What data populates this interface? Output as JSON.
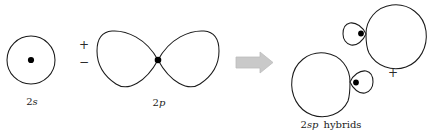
{
  "diagram": {
    "background_color": "#ffffff",
    "stroke_color": "#1a1a1a",
    "arrow_color": "#c9c9c9",
    "nucleus_color": "#000000"
  },
  "orbitals": {
    "s_orbital": {
      "label_prefix": "2",
      "label_suffix": "s",
      "label_full": "2s",
      "shape": "circle",
      "center_x": 31,
      "center_y": 60,
      "radius": 24,
      "has_nucleus_dot": true
    },
    "p_orbital": {
      "label_prefix": "2",
      "label_suffix": "p",
      "label_full": "2p",
      "shape": "figure-eight",
      "center_x": 158,
      "center_y": 60,
      "span_x": [
        97,
        219
      ],
      "lobe_half_height": 30,
      "has_nucleus_dot": true
    },
    "hybrid_upper": {
      "shape": "teardrop-pair",
      "small_lobe_center_x": 354,
      "small_lobe_center_y": 33,
      "large_lobe_center_x": 393,
      "large_lobe_center_y": 36,
      "has_nucleus_dot": true
    },
    "hybrid_lower": {
      "shape": "teardrop-pair",
      "small_lobe_center_x": 361,
      "small_lobe_center_y": 83,
      "large_lobe_center_x": 322,
      "large_lobe_center_y": 80,
      "has_nucleus_dot": true
    }
  },
  "signs": {
    "plus_between": "+",
    "minus_between": "−",
    "plus_hybrids": "+"
  },
  "labels": {
    "s_label": "2s",
    "p_label": "2p",
    "hybrid_label": "2sp  hybrids",
    "hybrid_label_prefix": "2",
    "hybrid_label_italic": "sp",
    "hybrid_label_suffix": "hybrids"
  },
  "arrow": {
    "name": "yields-arrow",
    "direction": "right",
    "x": 236,
    "y": 62,
    "color": "#c9c9c9"
  }
}
